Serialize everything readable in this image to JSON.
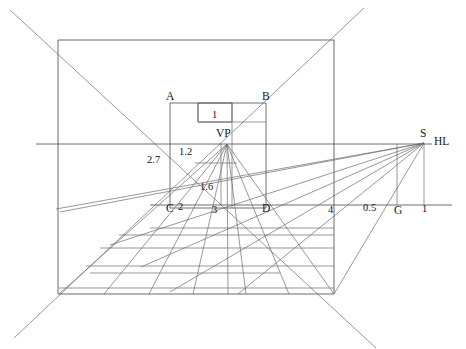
{
  "figure": {
    "type": "technical-line-drawing",
    "background_color": "#ffffff",
    "line_color": "#4a4a4a",
    "text_color": "#171717",
    "width": 466,
    "height": 349
  },
  "point_labels": [
    {
      "id": "A",
      "text": "A",
      "x": 166,
      "y": 100
    },
    {
      "id": "B",
      "text": "B",
      "x": 262,
      "y": 100
    },
    {
      "id": "C",
      "text": "C",
      "x": 166,
      "y": 212
    },
    {
      "id": "D",
      "text": "D",
      "x": 262,
      "y": 212
    },
    {
      "id": "VP",
      "text": "VP",
      "x": 216,
      "y": 137
    },
    {
      "id": "S",
      "text": "S",
      "x": 420,
      "y": 137
    },
    {
      "id": "HL",
      "text": "HL",
      "x": 434,
      "y": 145
    },
    {
      "id": "G",
      "text": "G",
      "x": 394,
      "y": 214
    }
  ],
  "measure_labels": [
    {
      "id": "one-top",
      "text": "1",
      "x": 212,
      "y": 118
    },
    {
      "id": "two-point-7",
      "text": "2.7",
      "x": 147,
      "y": 163
    },
    {
      "id": "one-point-2",
      "text": "1.2",
      "x": 179,
      "y": 155
    },
    {
      "id": "one-point-6",
      "text": "1.6",
      "x": 200,
      "y": 190
    },
    {
      "id": "two-c",
      "text": "2",
      "x": 178,
      "y": 210
    },
    {
      "id": "three",
      "text": "3",
      "x": 212,
      "y": 213
    },
    {
      "id": "four",
      "text": "4",
      "x": 328,
      "y": 213
    },
    {
      "id": "zero-five",
      "text": "0.5",
      "x": 363,
      "y": 211
    },
    {
      "id": "one-right",
      "text": "1",
      "x": 422,
      "y": 212
    }
  ],
  "geometry": {
    "outer_frame": {
      "x1": 58,
      "y1": 40,
      "x2": 334,
      "y2": 294
    },
    "inner_box": {
      "x1": 170,
      "y1": 103,
      "x2": 266,
      "y2": 208
    },
    "small_box": {
      "x1": 198,
      "y1": 103,
      "x2": 232,
      "y2": 122
    },
    "vanishing_point": {
      "x": 227,
      "y": 144
    },
    "station_point": {
      "x": 424,
      "y": 143
    },
    "horizon_line": {
      "x1": 36,
      "y1": 144,
      "x2": 432,
      "y2": 144
    },
    "ground_line": {
      "x1": 150,
      "y1": 205,
      "x2": 452,
      "y2": 205
    },
    "g_vertical": {
      "x": 397,
      "y1": 144,
      "y2": 205
    },
    "s_vertical": {
      "x": 424,
      "y1": 143,
      "y2": 205
    },
    "diagonals": [
      {
        "id": "diag-tl-br",
        "x1": 10,
        "y1": 10,
        "x2": 376,
        "y2": 348
      },
      {
        "id": "diag-bl-tr",
        "x1": 14,
        "y1": 338,
        "x2": 364,
        "y2": 8
      }
    ],
    "vp_floor_fan": [
      {
        "id": "vp-ray-1",
        "x2": 59,
        "y2": 294
      },
      {
        "id": "vp-ray-2",
        "x2": 104,
        "y2": 294
      },
      {
        "id": "vp-ray-3",
        "x2": 149,
        "y2": 294
      },
      {
        "id": "vp-ray-4",
        "x2": 193,
        "y2": 294
      },
      {
        "id": "vp-ray-5",
        "x2": 228,
        "y2": 294
      },
      {
        "id": "vp-ray-6",
        "x2": 246,
        "y2": 294
      },
      {
        "id": "vp-ray-7",
        "x2": 289,
        "y2": 294
      },
      {
        "id": "vp-ray-8",
        "x2": 334,
        "y2": 294
      }
    ],
    "s_floor_fan": [
      {
        "id": "s-ray-1",
        "x2": 56,
        "y2": 209
      },
      {
        "id": "s-ray-2",
        "x2": 60,
        "y2": 212
      },
      {
        "id": "s-ray-3",
        "x2": 110,
        "y2": 245
      },
      {
        "id": "s-ray-4",
        "x2": 141,
        "y2": 267
      },
      {
        "id": "s-ray-5",
        "x2": 170,
        "y2": 292
      },
      {
        "id": "s-ray-6",
        "x2": 238,
        "y2": 294
      },
      {
        "id": "s-ray-7",
        "x2": 334,
        "y2": 294
      }
    ],
    "floor_rows": [
      {
        "id": "floor-row-1",
        "x1": 119,
        "y1": 235,
        "x2": 334,
        "y2": 235
      },
      {
        "id": "floor-row-2",
        "x1": 100,
        "y1": 248,
        "x2": 334,
        "y2": 248
      },
      {
        "id": "floor-row-3",
        "x1": 86,
        "y1": 266,
        "x2": 334,
        "y2": 266
      },
      {
        "id": "floor-row-4",
        "x1": 59,
        "y1": 288,
        "x2": 334,
        "y2": 288
      }
    ],
    "floor_partials": [
      {
        "id": "floor-part-1",
        "x1": 150,
        "y1": 228,
        "x2": 334,
        "y2": 228
      },
      {
        "id": "floor-part-2",
        "x1": 90,
        "y1": 273,
        "x2": 280,
        "y2": 273
      }
    ],
    "inner_subdivisions": [
      {
        "id": "sub-horiz-1",
        "x1": 198,
        "y1": 122,
        "x2": 266,
        "y2": 122
      },
      {
        "id": "sub-horiz-2",
        "x1": 195,
        "y1": 163,
        "x2": 237,
        "y2": 163
      },
      {
        "id": "sub-vert-1",
        "x1": 198,
        "y1": 103,
        "x2": 198,
        "y2": 122
      },
      {
        "id": "sub-vert-2",
        "x1": 232,
        "y1": 103,
        "x2": 232,
        "y2": 208
      },
      {
        "id": "sub-vert-3",
        "x1": 221,
        "y1": 144,
        "x2": 221,
        "y2": 205
      }
    ]
  }
}
